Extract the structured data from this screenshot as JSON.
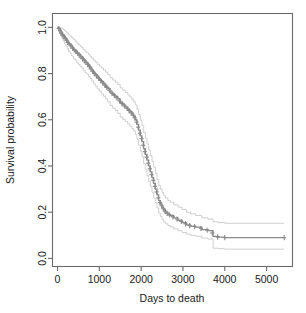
{
  "figure": {
    "background_color": "#ffffff",
    "curve_color": "#8a8a8a",
    "ci_color": "#c9c9c9",
    "axis_color": "#6b6b6b",
    "text_color": "#1a1a1a"
  },
  "axes": {
    "x_title": "Days to death",
    "y_title": "Survival probability",
    "x_ticks": [
      "0",
      "1000",
      "2000",
      "3000",
      "4000",
      "5000"
    ],
    "y_ticks": [
      "0.0",
      "0.2",
      "0.4",
      "0.6",
      "0.8",
      "1.0"
    ]
  },
  "chart_data": {
    "type": "line",
    "title": "",
    "xlabel": "Days to death",
    "ylabel": "Survival probability",
    "xlim": [
      -120,
      5620
    ],
    "ylim": [
      -0.035,
      1.06
    ],
    "grid": false,
    "legend": null,
    "x_ticks": [
      0,
      1000,
      2000,
      3000,
      4000,
      5000
    ],
    "y_ticks": [
      0.0,
      0.2,
      0.4,
      0.6,
      0.8,
      1.0
    ],
    "series": [
      {
        "name": "Kaplan-Meier survival estimate",
        "style": "step",
        "color": "#8a8a8a",
        "x": [
          0,
          40,
          80,
          110,
          140,
          170,
          200,
          230,
          260,
          300,
          340,
          380,
          420,
          460,
          500,
          540,
          580,
          620,
          660,
          700,
          740,
          780,
          820,
          860,
          900,
          950,
          1000,
          1050,
          1100,
          1150,
          1200,
          1260,
          1320,
          1380,
          1440,
          1500,
          1560,
          1620,
          1680,
          1730,
          1780,
          1820,
          1860,
          1900,
          1940,
          1980,
          2020,
          2060,
          2100,
          2140,
          2180,
          2220,
          2260,
          2300,
          2340,
          2380,
          2420,
          2460,
          2500,
          2540,
          2580,
          2640,
          2700,
          2780,
          2880,
          2980,
          3080,
          3180,
          3300,
          3450,
          3600,
          3720,
          3850,
          4000,
          4300,
          4700,
          5100,
          5420
        ],
        "y": [
          1.0,
          0.99,
          0.98,
          0.97,
          0.965,
          0.955,
          0.95,
          0.94,
          0.93,
          0.925,
          0.915,
          0.905,
          0.9,
          0.89,
          0.885,
          0.875,
          0.87,
          0.86,
          0.85,
          0.845,
          0.835,
          0.825,
          0.815,
          0.805,
          0.795,
          0.785,
          0.775,
          0.765,
          0.755,
          0.745,
          0.735,
          0.72,
          0.71,
          0.7,
          0.69,
          0.675,
          0.665,
          0.655,
          0.645,
          0.635,
          0.625,
          0.615,
          0.6,
          0.58,
          0.555,
          0.53,
          0.505,
          0.475,
          0.45,
          0.425,
          0.4,
          0.375,
          0.35,
          0.325,
          0.3,
          0.275,
          0.25,
          0.235,
          0.22,
          0.21,
          0.2,
          0.19,
          0.185,
          0.175,
          0.165,
          0.155,
          0.145,
          0.14,
          0.135,
          0.125,
          0.12,
          0.095,
          0.092,
          0.09,
          0.09,
          0.09,
          0.09,
          0.09
        ]
      },
      {
        "name": "Upper 95% confidence limit",
        "style": "step",
        "color": "#c9c9c9",
        "x": [
          0,
          40,
          80,
          110,
          140,
          170,
          200,
          230,
          260,
          300,
          340,
          380,
          420,
          460,
          500,
          540,
          580,
          620,
          660,
          700,
          740,
          780,
          820,
          860,
          900,
          950,
          1000,
          1050,
          1100,
          1150,
          1200,
          1260,
          1320,
          1380,
          1440,
          1500,
          1560,
          1620,
          1680,
          1730,
          1780,
          1820,
          1860,
          1900,
          1940,
          1980,
          2020,
          2060,
          2100,
          2140,
          2180,
          2220,
          2260,
          2300,
          2340,
          2380,
          2420,
          2460,
          2500,
          2540,
          2580,
          2640,
          2700,
          2780,
          2880,
          2980,
          3080,
          3180,
          3300,
          3450,
          3600,
          3720,
          3850,
          4000,
          4300,
          4700,
          5100,
          5420
        ],
        "y": [
          1.0,
          1.0,
          0.998,
          0.995,
          0.99,
          0.985,
          0.98,
          0.975,
          0.968,
          0.962,
          0.955,
          0.948,
          0.94,
          0.932,
          0.926,
          0.918,
          0.912,
          0.904,
          0.896,
          0.89,
          0.882,
          0.874,
          0.866,
          0.858,
          0.85,
          0.84,
          0.832,
          0.824,
          0.814,
          0.806,
          0.796,
          0.782,
          0.772,
          0.762,
          0.752,
          0.738,
          0.728,
          0.718,
          0.708,
          0.698,
          0.688,
          0.678,
          0.665,
          0.645,
          0.622,
          0.598,
          0.575,
          0.545,
          0.52,
          0.495,
          0.47,
          0.445,
          0.42,
          0.395,
          0.368,
          0.342,
          0.316,
          0.3,
          0.285,
          0.272,
          0.262,
          0.25,
          0.243,
          0.232,
          0.222,
          0.212,
          0.2,
          0.193,
          0.186,
          0.176,
          0.17,
          0.158,
          0.155,
          0.152,
          0.152,
          0.152,
          0.152,
          0.152
        ]
      },
      {
        "name": "Lower 95% confidence limit",
        "style": "step",
        "color": "#c9c9c9",
        "x": [
          0,
          40,
          80,
          110,
          140,
          170,
          200,
          230,
          260,
          300,
          340,
          380,
          420,
          460,
          500,
          540,
          580,
          620,
          660,
          700,
          740,
          780,
          820,
          860,
          900,
          950,
          1000,
          1050,
          1100,
          1150,
          1200,
          1260,
          1320,
          1380,
          1440,
          1500,
          1560,
          1620,
          1680,
          1730,
          1780,
          1820,
          1860,
          1900,
          1940,
          1980,
          2020,
          2060,
          2100,
          2140,
          2180,
          2220,
          2260,
          2300,
          2340,
          2380,
          2420,
          2460,
          2500,
          2540,
          2580,
          2640,
          2700,
          2780,
          2880,
          2980,
          3080,
          3180,
          3300,
          3450,
          3600,
          3720,
          3850,
          4000,
          4300,
          4700,
          5100,
          5420
        ],
        "y": [
          1.0,
          0.975,
          0.962,
          0.95,
          0.94,
          0.928,
          0.92,
          0.908,
          0.896,
          0.888,
          0.876,
          0.864,
          0.858,
          0.846,
          0.84,
          0.83,
          0.824,
          0.814,
          0.804,
          0.798,
          0.788,
          0.778,
          0.768,
          0.758,
          0.746,
          0.734,
          0.724,
          0.712,
          0.702,
          0.69,
          0.678,
          0.662,
          0.65,
          0.64,
          0.628,
          0.612,
          0.602,
          0.592,
          0.582,
          0.572,
          0.562,
          0.552,
          0.536,
          0.516,
          0.49,
          0.464,
          0.44,
          0.41,
          0.384,
          0.358,
          0.334,
          0.31,
          0.286,
          0.262,
          0.24,
          0.218,
          0.196,
          0.182,
          0.168,
          0.158,
          0.15,
          0.142,
          0.136,
          0.128,
          0.12,
          0.112,
          0.105,
          0.1,
          0.096,
          0.088,
          0.084,
          0.044,
          0.042,
          0.04,
          0.04,
          0.04,
          0.04,
          0.04
        ]
      }
    ],
    "censored_points": {
      "marker": "+",
      "x": [
        30,
        60,
        90,
        120,
        150,
        185,
        215,
        245,
        280,
        320,
        360,
        400,
        440,
        480,
        520,
        560,
        600,
        640,
        680,
        720,
        760,
        800,
        840,
        880,
        930,
        980,
        1030,
        1080,
        1130,
        1180,
        1240,
        1300,
        1360,
        1420,
        1480,
        1540,
        1600,
        1660,
        1710,
        1760,
        1810,
        1850,
        1890,
        1930,
        1970,
        2010,
        2050,
        2090,
        2130,
        2170,
        2210,
        2250,
        2290,
        2330,
        2370,
        2410,
        2450,
        2490,
        2530,
        2570,
        2620,
        2680,
        2760,
        2860,
        2960,
        3060,
        3160,
        3280,
        3430,
        3580,
        3700,
        3830,
        4000,
        5420
      ],
      "y": [
        0.995,
        0.985,
        0.975,
        0.968,
        0.96,
        0.952,
        0.945,
        0.935,
        0.928,
        0.92,
        0.91,
        0.902,
        0.895,
        0.888,
        0.88,
        0.872,
        0.865,
        0.855,
        0.848,
        0.84,
        0.83,
        0.82,
        0.81,
        0.8,
        0.79,
        0.78,
        0.77,
        0.76,
        0.75,
        0.74,
        0.728,
        0.715,
        0.705,
        0.695,
        0.682,
        0.67,
        0.66,
        0.65,
        0.64,
        0.63,
        0.62,
        0.608,
        0.59,
        0.568,
        0.542,
        0.518,
        0.49,
        0.462,
        0.438,
        0.412,
        0.388,
        0.362,
        0.338,
        0.312,
        0.288,
        0.262,
        0.242,
        0.228,
        0.215,
        0.205,
        0.195,
        0.188,
        0.18,
        0.17,
        0.16,
        0.15,
        0.142,
        0.138,
        0.13,
        0.122,
        0.11,
        0.092,
        0.09,
        0.09
      ]
    }
  }
}
